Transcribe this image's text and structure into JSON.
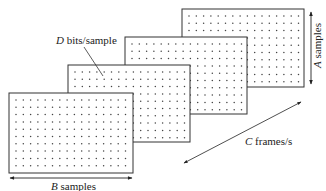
{
  "diagram": {
    "title": "",
    "frames": [
      {
        "id": "frame-4",
        "x": 182,
        "y": 9,
        "w": 122,
        "h": 78
      },
      {
        "id": "frame-3",
        "x": 125,
        "y": 37,
        "w": 122,
        "h": 77
      },
      {
        "id": "frame-2",
        "x": 68,
        "y": 65,
        "w": 122,
        "h": 77
      },
      {
        "id": "frame-1",
        "x": 9,
        "y": 93,
        "w": 124,
        "h": 80
      }
    ],
    "labels": {
      "depth": {
        "var": "D",
        "text": " bits/sample"
      },
      "height": {
        "var": "A",
        "text": " samples"
      },
      "width": {
        "var": "B",
        "text": " samples"
      },
      "rate": {
        "var": "C",
        "text": " frames/s"
      }
    },
    "colors": {
      "line": "#333333",
      "dot": "#444444",
      "text": "#222222",
      "background": "#ffffff"
    }
  }
}
